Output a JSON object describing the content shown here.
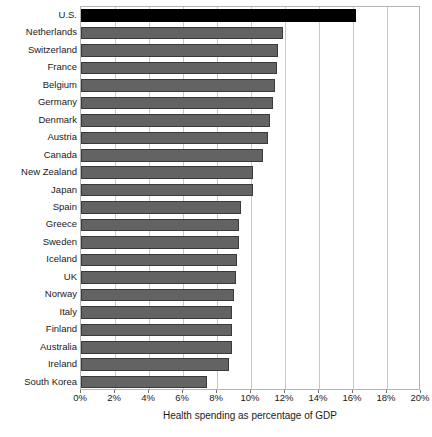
{
  "chart_data": {
    "type": "bar",
    "orientation": "horizontal",
    "title": "",
    "xlabel": "Health spending as percentage of GDP",
    "ylabel": "",
    "xlim": [
      0,
      20
    ],
    "xticks": [
      "0%",
      "2%",
      "4%",
      "6%",
      "8%",
      "10%",
      "12%",
      "14%",
      "16%",
      "18%",
      "20%"
    ],
    "xtick_values": [
      0,
      2,
      4,
      6,
      8,
      10,
      12,
      14,
      16,
      18,
      20
    ],
    "grid": true,
    "legend": "none",
    "categories": [
      "U.S.",
      "Netherlands",
      "Switzerland",
      "France",
      "Belgium",
      "Germany",
      "Denmark",
      "Austria",
      "Canada",
      "New Zealand",
      "Japan",
      "Spain",
      "Greece",
      "Sweden",
      "Iceland",
      "UK",
      "Norway",
      "Italy",
      "Finland",
      "Australia",
      "Ireland",
      "South Korea"
    ],
    "values": [
      16.2,
      11.9,
      11.6,
      11.5,
      11.4,
      11.3,
      11.1,
      11.0,
      10.7,
      10.1,
      10.1,
      9.4,
      9.3,
      9.3,
      9.2,
      9.1,
      9.0,
      8.9,
      8.9,
      8.9,
      8.7,
      7.4
    ],
    "bar_colors": [
      "#000000",
      "#636363",
      "#636363",
      "#636363",
      "#636363",
      "#636363",
      "#636363",
      "#636363",
      "#636363",
      "#636363",
      "#636363",
      "#636363",
      "#636363",
      "#636363",
      "#636363",
      "#636363",
      "#636363",
      "#636363",
      "#636363",
      "#636363",
      "#636363",
      "#636363"
    ],
    "highlight_index": 0,
    "accent_color": "#636363",
    "highlight_color": "#000000",
    "grid_color": "#c8c8c8",
    "frame_color": "#b4b4b4"
  }
}
